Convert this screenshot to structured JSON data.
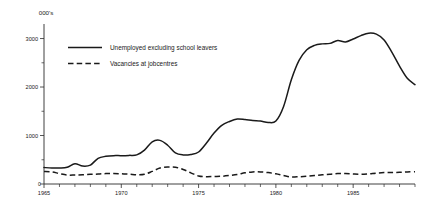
{
  "chart_data": {
    "type": "line",
    "title": "",
    "xlabel": "",
    "ylabel": "000's",
    "unit_label": "000's",
    "xlim": [
      1965,
      1989
    ],
    "ylim": [
      0,
      3300
    ],
    "y_ticks": [
      0,
      1000,
      2000,
      3000
    ],
    "y_tick_labels": [
      "0",
      "1000",
      "2000",
      "3000"
    ],
    "y_minor_ticks": [
      500,
      1500,
      2500
    ],
    "x_ticks": [
      1965,
      1966,
      1967,
      1968,
      1969,
      1970,
      1971,
      1972,
      1973,
      1974,
      1975,
      1976,
      1977,
      1978,
      1979,
      1980,
      1981,
      1982,
      1983,
      1984,
      1985,
      1986,
      1987,
      1988,
      1989
    ],
    "x_tick_labels": [
      "1965",
      "",
      "",
      "",
      "",
      "1970",
      "",
      "",
      "",
      "",
      "1975",
      "",
      "",
      "",
      "",
      "1980",
      "",
      "",
      "",
      "",
      "1985",
      "",
      "",
      "",
      ""
    ],
    "grid": false,
    "legend_position": "upper-left-inside",
    "zero_label": "0",
    "x": [
      1965,
      1965.5,
      1966,
      1966.5,
      1967,
      1967.5,
      1968,
      1968.5,
      1969,
      1969.5,
      1970,
      1970.5,
      1971,
      1971.5,
      1972,
      1972.5,
      1973,
      1973.5,
      1974,
      1974.5,
      1975,
      1975.5,
      1976,
      1976.5,
      1977,
      1977.5,
      1978,
      1978.5,
      1979,
      1979.5,
      1980,
      1980.5,
      1981,
      1981.5,
      1982,
      1982.5,
      1983,
      1983.5,
      1984,
      1984.5,
      1985,
      1985.5,
      1986,
      1986.5,
      1987,
      1987.5,
      1988,
      1988.5,
      1989
    ],
    "series": [
      {
        "name": "Unemployed excluding school leavers",
        "style": "solid",
        "color": "#1a1a1a",
        "values": [
          340,
          330,
          330,
          345,
          420,
          370,
          390,
          530,
          570,
          585,
          585,
          590,
          600,
          700,
          870,
          900,
          800,
          640,
          600,
          610,
          660,
          840,
          1050,
          1210,
          1290,
          1340,
          1330,
          1310,
          1300,
          1270,
          1300,
          1600,
          2150,
          2550,
          2770,
          2860,
          2890,
          2900,
          2960,
          2930,
          2990,
          3060,
          3110,
          3090,
          2970,
          2720,
          2430,
          2180,
          2050
        ]
      },
      {
        "name": "Vacancies at jobcentres",
        "style": "dashed",
        "color": "#1a1a1a",
        "values": [
          260,
          250,
          215,
          185,
          185,
          190,
          200,
          205,
          215,
          215,
          210,
          205,
          190,
          200,
          260,
          330,
          350,
          345,
          300,
          230,
          165,
          150,
          155,
          160,
          175,
          195,
          230,
          250,
          250,
          235,
          210,
          175,
          145,
          150,
          160,
          175,
          190,
          200,
          215,
          215,
          205,
          200,
          210,
          225,
          235,
          235,
          240,
          250,
          255
        ]
      }
    ]
  },
  "legend": {
    "items": [
      {
        "label": "Unemployed excluding school leavers",
        "style": "solid"
      },
      {
        "label": "Vacancies at jobcentres",
        "style": "dashed"
      }
    ]
  }
}
